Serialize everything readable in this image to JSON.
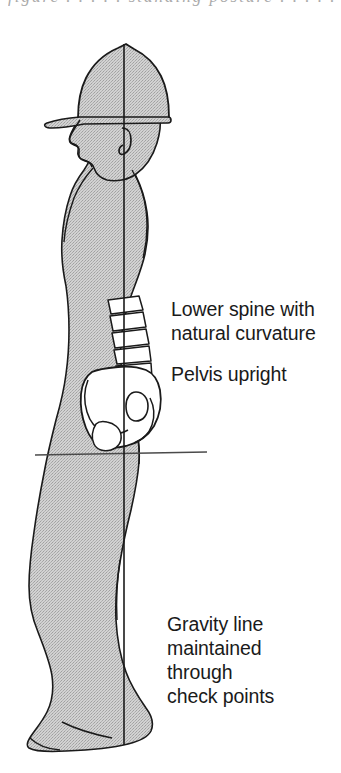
{
  "page": {
    "background_color": "#ffffff",
    "width": 341,
    "height": 773
  },
  "figure": {
    "name": "side-view-standing-person-with-hard-hat",
    "body_fill_color": "#c9c9c9",
    "outline_color": "#1a1a1a",
    "bone_fill_color": "#ffffff",
    "orientation": "facing-left-profile",
    "parts": [
      "hard-hat",
      "head-profile",
      "ear",
      "neck",
      "torso",
      "lumbar-spine",
      "pelvis",
      "thigh",
      "knee",
      "calf",
      "foot"
    ]
  },
  "gravity_line": {
    "label": "vertical-plumb-line",
    "color": "#1a1a1a",
    "x": 124,
    "y_top": 44,
    "y_bottom": 745
  },
  "horizontal_reference_line": {
    "label": "hip-level-horizontal-line",
    "color": "#4a4a4a",
    "x_start": 35,
    "x_end": 207,
    "y": 455
  },
  "callouts": {
    "spine": "Lower spine with\nnatural curvature",
    "pelvis": "Pelvis upright",
    "gravity": "Gravity line\nmaintained\nthrough\ncheck points"
  },
  "clipped_header": {
    "text": "figure  .  .  .  .  .  standing posture  .  .  .  .  .  .  .  gy"
  }
}
